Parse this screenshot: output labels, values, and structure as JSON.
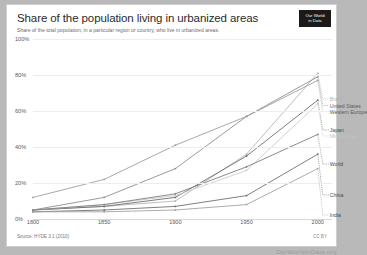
{
  "header": {
    "title": "Share of the population living in urbanized areas",
    "subtitle": "Share of the total population, in a particular region or country, who live in urbanized areas.",
    "logo_line1": "Our World",
    "logo_line2": "in Data"
  },
  "footer": {
    "source": "Source: HYDE 3.1 (2010)",
    "license": "CC BY",
    "watermark": "OurWorldInData.org"
  },
  "chart_data": {
    "type": "line",
    "title": "Share of the population living in urbanized areas",
    "subtitle": "Share of the total population, in a particular region or country, who live in urbanized areas.",
    "xlabel": "",
    "ylabel": "",
    "xlim": [
      1800,
      2010
    ],
    "ylim": [
      0,
      100
    ],
    "xticks": [
      1800,
      1850,
      1900,
      1950,
      2000
    ],
    "xtick_labels": [
      "1800",
      "1850",
      "1900",
      "1950",
      "2000"
    ],
    "yticks": [
      0,
      20,
      40,
      60,
      80,
      100
    ],
    "ytick_labels": [
      "0%",
      "20%",
      "40%",
      "60%",
      "80%",
      "100%"
    ],
    "grid": true,
    "legend_position": "right-inline",
    "x": [
      1800,
      1850,
      1900,
      1950,
      2000
    ],
    "series": [
      {
        "name": "Brazil",
        "color": "#b5b5b5",
        "values": [
          5,
          7,
          10,
          36,
          81
        ]
      },
      {
        "name": "United States",
        "color": "#8f8f8f",
        "values": [
          5,
          12,
          28,
          57,
          79
        ]
      },
      {
        "name": "Western Europe",
        "color": "#9e9e9e",
        "values": [
          12,
          22,
          41,
          57,
          77
        ]
      },
      {
        "name": "Japan",
        "color": "#6e6e6e",
        "values": [
          5,
          7,
          12,
          35,
          66
        ]
      },
      {
        "name": "Middle East",
        "color": "#cccccc",
        "values": [
          5,
          8,
          13,
          27,
          64
        ]
      },
      {
        "name": "World",
        "color": "#7d7d7d",
        "values": [
          5,
          8,
          14,
          29,
          47
        ]
      },
      {
        "name": "China",
        "color": "#707070",
        "values": [
          4,
          5,
          7,
          13,
          36
        ]
      },
      {
        "name": "India",
        "color": "#a3a3a3",
        "values": [
          4,
          4,
          5,
          8,
          28
        ]
      }
    ]
  },
  "legend": [
    {
      "label": "Brazil",
      "color": "#b0b0b0"
    },
    {
      "label": "United States",
      "color": "#5a5a5a"
    },
    {
      "label": "Western Europe",
      "color": "#5a5a5a"
    },
    {
      "label": "Japan",
      "color": "#4a4a4a"
    },
    {
      "label": "Middle East",
      "color": "#c2c2c2"
    },
    {
      "label": "World",
      "color": "#4a4a4a"
    },
    {
      "label": "China",
      "color": "#4a4a4a"
    },
    {
      "label": "India",
      "color": "#4a4a4a"
    }
  ]
}
